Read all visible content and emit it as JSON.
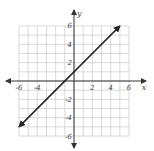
{
  "chart_data": {
    "type": "line",
    "title": "",
    "xlabel": "x",
    "ylabel": "y",
    "xlim": [
      -6,
      6
    ],
    "ylim": [
      -6,
      6
    ],
    "grid": true,
    "grid_step": 1,
    "x_ticks": [
      -6,
      -4,
      2,
      4,
      6
    ],
    "x_tick_labels": [
      "-6",
      "-4",
      "2",
      "4",
      "6"
    ],
    "y_ticks": [
      6,
      4,
      2,
      -2,
      -4,
      -6
    ],
    "y_tick_labels": [
      "6",
      "4",
      "2",
      "-2",
      "-4",
      "-6"
    ],
    "series": [
      {
        "name": "y = x + 1",
        "equation": "y = x + 1",
        "x": [
          -6,
          5
        ],
        "y": [
          -5,
          6
        ],
        "arrows": "both"
      }
    ],
    "legend": null
  },
  "colors": {
    "grid": "#c8c8c8",
    "axis": "#333333",
    "line": "#222222",
    "text": "#444444"
  }
}
